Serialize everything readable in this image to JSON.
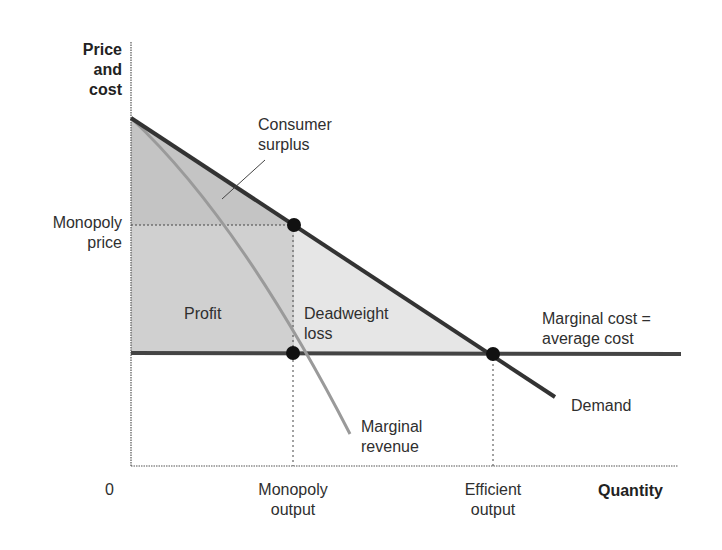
{
  "diagram": {
    "type": "economics monopoly diagram",
    "y_axis_label": [
      "Price",
      "and",
      "cost"
    ],
    "x_axis_label": "Quantity",
    "origin_label": "0",
    "y_ticks": {
      "monopoly_price": [
        "Monopoly",
        "price"
      ]
    },
    "x_ticks": {
      "monopoly_output": [
        "Monopoly",
        "output"
      ],
      "efficient_output": [
        "Efficient",
        "output"
      ]
    },
    "curves": {
      "demand": "Demand",
      "marginal_revenue": [
        "Marginal",
        "revenue"
      ],
      "marginal_cost": [
        "Marginal cost =",
        "average cost"
      ]
    },
    "regions": {
      "consumer_surplus": [
        "Consumer",
        "surplus"
      ],
      "profit": "Profit",
      "deadweight_loss": [
        "Deadweight",
        "loss"
      ]
    },
    "colors": {
      "demand": "#333333",
      "marginal_revenue": "#9a9a9a",
      "marginal_cost": "#444444",
      "consumer_surplus_fill": "#c4c4c4",
      "profit_fill": "#d0d0d0",
      "deadweight_fill": "#e6e6e6",
      "points": "#111111"
    },
    "points": [
      {
        "name": "monopoly-point",
        "x": 294,
        "y": 225
      },
      {
        "name": "mr-equals-mc-point",
        "x": 293,
        "y": 353
      },
      {
        "name": "efficient-point",
        "x": 493,
        "y": 354
      }
    ]
  }
}
